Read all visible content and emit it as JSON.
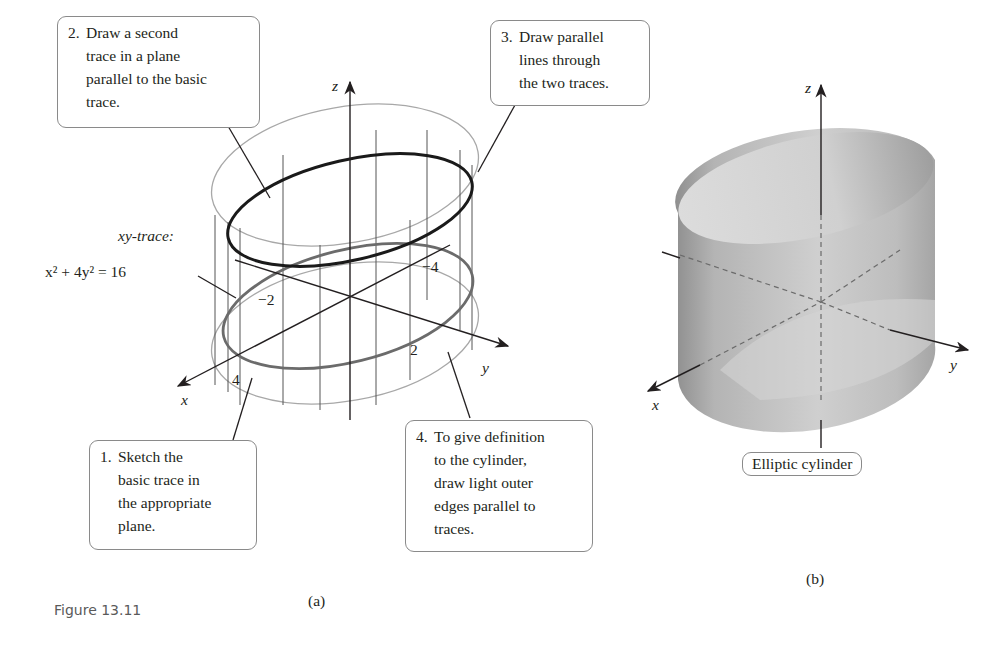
{
  "figure": {
    "caption": "Figure 13.11",
    "panel_a": {
      "label": "(a)",
      "callouts": [
        {
          "num": "1.",
          "text": "Sketch the\nbasic trace in\nthe appropriate\nplane."
        },
        {
          "num": "2.",
          "text": "Draw a second\ntrace in a plane\nparallel to the basic\ntrace."
        },
        {
          "num": "3.",
          "text": "Draw parallel\nlines through\nthe two traces."
        },
        {
          "num": "4.",
          "text": "To give definition\nto the cylinder,\ndraw light outer\nedges parallel to\ntraces."
        }
      ],
      "trace_label_line1": "xy-trace:",
      "trace_equation": "x² + 4y² = 16",
      "axes": {
        "x": "x",
        "y": "y",
        "z": "z"
      },
      "ticks": {
        "x_pos": "4",
        "x_neg": "−2",
        "y_pos": "2",
        "y_neg": "−4"
      }
    },
    "panel_b": {
      "label": "(b)",
      "name": "Elliptic cylinder",
      "axes": {
        "x": "x",
        "y": "y",
        "z": "z"
      }
    }
  }
}
